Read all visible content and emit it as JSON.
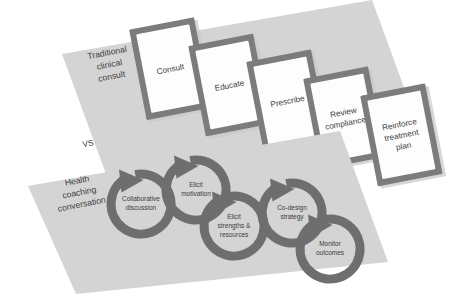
{
  "diagram": {
    "title_visible": false,
    "rotation_degrees": -11,
    "colors": {
      "background": "#ffffff",
      "band_fill": "#d4d4d4",
      "card_border": "#7c7c7c",
      "card_face": "#fdfdfd",
      "ring_stroke": "#6e6e6e",
      "text": "#3d3d3d"
    },
    "separator": {
      "label": "VS"
    },
    "top_track": {
      "side_label_lines": [
        "Traditional",
        "clinical",
        "consult"
      ],
      "steps": [
        {
          "lines": [
            "Consult"
          ]
        },
        {
          "lines": [
            "Educate"
          ]
        },
        {
          "lines": [
            "Prescribe"
          ]
        },
        {
          "lines": [
            "Review",
            "compliance"
          ]
        },
        {
          "lines": [
            "Reinforce",
            "treatment",
            "plan"
          ]
        }
      ]
    },
    "bottom_track": {
      "side_label_lines": [
        "Health",
        "coaching",
        "conversation"
      ],
      "steps": [
        {
          "lines": [
            "Collaborative",
            "discussion"
          ]
        },
        {
          "lines": [
            "Elicit",
            "motivation"
          ]
        },
        {
          "lines": [
            "Elicit",
            "strengths &",
            "resources"
          ]
        },
        {
          "lines": [
            "Co-design",
            "strategy"
          ]
        },
        {
          "lines": [
            "Monitor",
            "outcomes"
          ]
        }
      ]
    }
  }
}
